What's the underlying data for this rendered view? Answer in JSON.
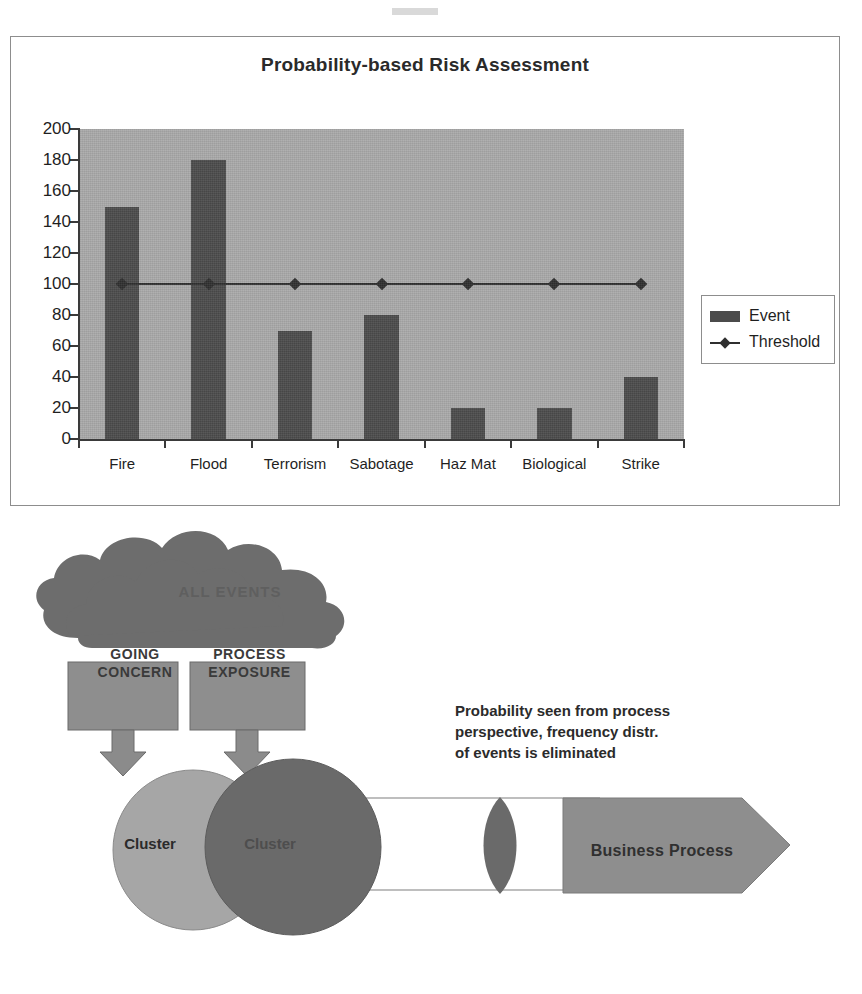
{
  "chart_data": {
    "type": "bar",
    "title": "Probability-based Risk Assessment",
    "xlabel": "",
    "ylabel": "",
    "ylim": [
      0,
      200
    ],
    "ytick_step": 20,
    "grid": false,
    "legend_position": "right",
    "categories": [
      "Fire",
      "Flood",
      "Terrorism",
      "Sabotage",
      "Haz Mat",
      "Biological",
      "Strike"
    ],
    "yticks": [
      "200",
      "180",
      "160",
      "140",
      "120",
      "100",
      "80",
      "60",
      "40",
      "20",
      "0"
    ],
    "series": [
      {
        "name": "Event",
        "type": "bar",
        "color": "#4b4b4b",
        "values": [
          150,
          180,
          70,
          80,
          20,
          20,
          40
        ]
      },
      {
        "name": "Threshold",
        "type": "line",
        "color": "#2f2f2f",
        "marker": "diamond",
        "values": [
          100,
          100,
          100,
          100,
          100,
          100,
          100
        ]
      }
    ],
    "legend": [
      "Event",
      "Threshold"
    ],
    "plot_background": "#a9a9a9"
  },
  "chart": {
    "title": "Probability-based Risk Assessment",
    "legend": {
      "event_label": "Event",
      "threshold_label": "Threshold"
    }
  },
  "diagram": {
    "cloud_label": "ALL EVENTS",
    "box_going_concern": "GOING\nCONCERN",
    "box_going_concern_line1": "GOING",
    "box_going_concern_line2": "CONCERN",
    "box_process_exposure_line1": "PROCESS",
    "box_process_exposure_line2": "EXPOSURE",
    "cluster_left_label": "Cluster",
    "cluster_right_label": "Cluster",
    "business_process_label": "Business Process",
    "annotation_line1": "Probability seen from process",
    "annotation_line2": "perspective, frequency distr.",
    "annotation_line3": "of events is eliminated",
    "colors": {
      "cloud": "#6d6d6d",
      "box": "#8e8e8e",
      "arrow": "#8b8b8b",
      "cluster_left": "#a6a6a6",
      "cluster_right": "#6a6a6a",
      "lens": "#6a6a6a",
      "business_process": "#8e8e8e"
    }
  }
}
